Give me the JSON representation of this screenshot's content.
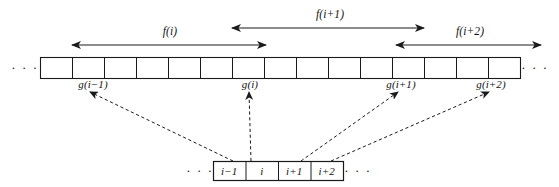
{
  "figure": {
    "colors": {
      "stroke": "#1a1a1a",
      "dashed_stroke": "#1a1a1a",
      "text": "#111111",
      "background": "#ffffff"
    },
    "ellipsis": "· · ·"
  },
  "f_arrows": [
    {
      "label": "f(i)",
      "x1": 72,
      "x2": 266,
      "y": 45,
      "label_x": 170,
      "label_y": 31,
      "direction": "both"
    },
    {
      "label": "f(i+1)",
      "x1": 232,
      "x2": 424,
      "y": 28,
      "label_x": 330,
      "label_y": 14,
      "direction": "both"
    },
    {
      "label": "f(i+2)",
      "x1": 396,
      "x2": 541,
      "y": 45,
      "label_x": 470,
      "label_y": 31,
      "direction": "both"
    }
  ],
  "top_strip": {
    "x": 40,
    "y": 57,
    "cell_width": 32,
    "cell_count": 15,
    "height": 21,
    "left_ellipsis_x": 25,
    "right_ellipsis_x": 535,
    "ellipsis_y": 68
  },
  "g_labels": [
    {
      "text": "g(i−1)",
      "x": 93,
      "y": 84
    },
    {
      "text": "g(i)",
      "x": 250,
      "y": 84
    },
    {
      "text": "g(i+1)",
      "x": 401,
      "y": 84
    },
    {
      "text": "g(i+2)",
      "x": 491,
      "y": 84
    }
  ],
  "dashed_arrows": [
    {
      "name": "arrow-to-g-i-minus-1",
      "x1": 233,
      "y1": 161,
      "x2": 90,
      "y2": 92
    },
    {
      "name": "arrow-to-g-i",
      "x1": 251,
      "y1": 161,
      "x2": 249,
      "y2": 92
    },
    {
      "name": "arrow-to-g-i-plus-1",
      "x1": 301,
      "y1": 161,
      "x2": 398,
      "y2": 92
    },
    {
      "name": "arrow-to-g-i-plus-2",
      "x1": 331,
      "y1": 161,
      "x2": 489,
      "y2": 92
    }
  ],
  "bottom_strip": {
    "x": 213,
    "y": 161,
    "cell_width": 32.5,
    "height": 19,
    "cells": [
      "i−1",
      "i",
      "i+1",
      "i+2"
    ],
    "left_ellipsis_x": 200,
    "right_ellipsis_x": 358,
    "ellipsis_y": 171
  }
}
